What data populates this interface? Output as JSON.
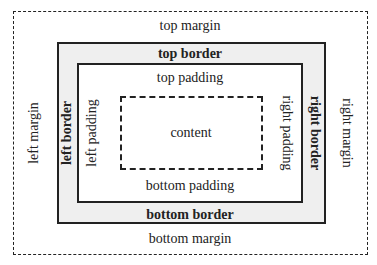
{
  "diagram": {
    "layers": {
      "margin": {
        "top": "top margin",
        "bottom": "bottom margin",
        "left": "left margin",
        "right": "right margin"
      },
      "border": {
        "top": "top border",
        "bottom": "bottom border",
        "left": "left border",
        "right": "right border"
      },
      "padding": {
        "top": "top padding",
        "bottom": "bottom padding",
        "left": "left padding",
        "right": "right padding"
      },
      "content": "content"
    },
    "colors": {
      "border_fill": "#efefef",
      "line": "#222222",
      "background": "#ffffff"
    }
  }
}
